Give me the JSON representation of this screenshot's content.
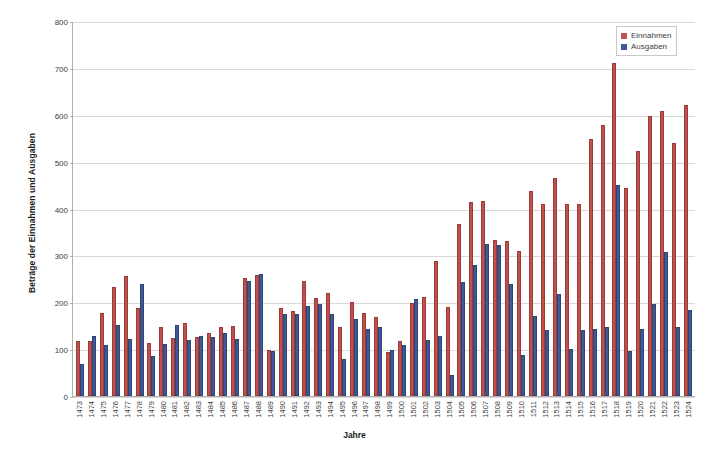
{
  "chart_data": {
    "type": "bar",
    "title": "",
    "xlabel": "Jahre",
    "ylabel": "Beträge der Einnahmen und Ausgaben",
    "ylim": [
      0,
      800
    ],
    "yticks": [
      0,
      100,
      200,
      300,
      400,
      500,
      600,
      700,
      800
    ],
    "grid": true,
    "legend_position": "top-right",
    "colors": {
      "einnahmen": "#C0504D",
      "ausgaben": "#3D5A98"
    },
    "categories": [
      "1473",
      "1474",
      "1475",
      "1476",
      "1477",
      "1478",
      "1479",
      "1480",
      "1481",
      "1482",
      "1483",
      "1484",
      "1485",
      "1486",
      "1487",
      "1488",
      "1489",
      "1490",
      "1491",
      "1492",
      "1493",
      "1494",
      "1495",
      "1496",
      "1497",
      "1498",
      "1499",
      "1500",
      "1501",
      "1502",
      "1503",
      "1504",
      "1505",
      "1506",
      "1507",
      "1508",
      "1509",
      "1510",
      "1511",
      "1512",
      "1513",
      "1514",
      "1515",
      "1516",
      "1517",
      "1518",
      "1519",
      "1520",
      "1521",
      "1522",
      "1523",
      "1524"
    ],
    "series": [
      {
        "name": "Einnahmen",
        "color": "#C0504D",
        "values": [
          118,
          117,
          178,
          232,
          256,
          187,
          113,
          147,
          124,
          155,
          125,
          135,
          147,
          150,
          252,
          259,
          98,
          188,
          181,
          245,
          210,
          219,
          148,
          200,
          178,
          169,
          93,
          117,
          199,
          212,
          287,
          189,
          368,
          414,
          415,
          332,
          330,
          310,
          437,
          410,
          465,
          410,
          410,
          548,
          578,
          710,
          443,
          523,
          598,
          607,
          540,
          620
        ]
      },
      {
        "name": "Ausgaben",
        "color": "#3D5A98",
        "values": [
          69,
          129,
          108,
          151,
          121,
          240,
          86,
          110,
          152,
          119,
          127,
          126,
          134,
          121,
          245,
          261,
          95,
          174,
          175,
          192,
          197,
          175,
          80,
          164,
          142,
          147,
          98,
          108,
          207,
          120,
          127,
          45,
          243,
          279,
          325,
          323,
          240,
          88,
          170,
          140,
          218,
          101,
          140,
          144,
          147,
          450,
          95,
          144,
          197,
          308,
          147,
          183
        ]
      }
    ]
  },
  "legend": {
    "items": [
      {
        "label": "Einnahmen",
        "color": "#C0504D"
      },
      {
        "label": "Ausgaben",
        "color": "#3D5A98"
      }
    ]
  }
}
